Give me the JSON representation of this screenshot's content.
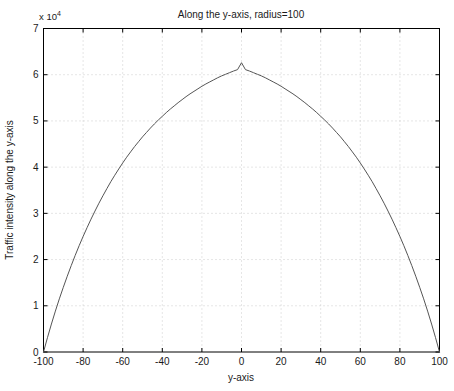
{
  "chart_data": {
    "type": "line",
    "title": "Along the y-axis, radius=100",
    "xlabel": "y-axis",
    "ylabel": "Traffic intensity along the y-axis",
    "y_exponent_label": "x 10",
    "y_exponent_power": "4",
    "y_scale_factor": 10000,
    "xlim": [
      -100,
      100
    ],
    "ylim": [
      0,
      70000
    ],
    "xticks": [
      -100,
      -80,
      -60,
      -40,
      -20,
      0,
      20,
      40,
      60,
      80,
      100
    ],
    "xticklabels": [
      "-100",
      "-80",
      "-60",
      "-40",
      "-20",
      "0",
      "20",
      "40",
      "60",
      "80",
      "100"
    ],
    "yticks": [
      0,
      10000,
      20000,
      30000,
      40000,
      50000,
      60000,
      70000
    ],
    "yticklabels": [
      "0",
      "1",
      "2",
      "3",
      "4",
      "5",
      "6",
      "7"
    ],
    "grid": true,
    "legend": false,
    "line_color": "#555555",
    "grid_color": "#cccccc",
    "axes_color": "#000000",
    "series": [
      {
        "name": "Traffic intensity along the y-axis",
        "x": [
          -100,
          -98,
          -96,
          -94,
          -92,
          -90,
          -88,
          -86,
          -84,
          -82,
          -80,
          -78,
          -76,
          -74,
          -72,
          -70,
          -68,
          -66,
          -64,
          -62,
          -60,
          -58,
          -56,
          -54,
          -52,
          -50,
          -48,
          -46,
          -44,
          -42,
          -40,
          -38,
          -36,
          -34,
          -32,
          -30,
          -28,
          -26,
          -24,
          -22,
          -20,
          -18,
          -16,
          -14,
          -12,
          -10,
          -8,
          -6,
          -4,
          -2,
          0,
          2,
          4,
          6,
          8,
          10,
          12,
          14,
          16,
          18,
          20,
          22,
          24,
          26,
          28,
          30,
          32,
          34,
          36,
          38,
          40,
          42,
          44,
          46,
          48,
          50,
          52,
          54,
          56,
          58,
          60,
          62,
          64,
          66,
          68,
          70,
          72,
          74,
          76,
          78,
          80,
          82,
          84,
          86,
          88,
          90,
          92,
          94,
          96,
          98,
          100
        ],
        "y": [
          0,
          3100,
          6050,
          8850,
          11500,
          14000,
          16400,
          18700,
          20900,
          23000,
          25000,
          26900,
          28750,
          30500,
          32200,
          33800,
          35350,
          36850,
          38250,
          39600,
          40900,
          42150,
          43300,
          44450,
          45500,
          46550,
          47500,
          48450,
          49350,
          50200,
          51000,
          51800,
          52550,
          53250,
          53950,
          54600,
          55250,
          55850,
          56400,
          56950,
          57500,
          58000,
          58450,
          58900,
          59350,
          59750,
          60100,
          60450,
          60800,
          61100,
          62600,
          61100,
          60800,
          60450,
          60100,
          59750,
          59350,
          58900,
          58450,
          58000,
          57500,
          56950,
          56400,
          55850,
          55250,
          54600,
          53950,
          53250,
          52550,
          51800,
          51000,
          50200,
          49350,
          48450,
          47500,
          46550,
          45500,
          44450,
          43300,
          42150,
          40900,
          39600,
          38250,
          36850,
          35350,
          33800,
          32200,
          30500,
          28750,
          26900,
          25000,
          23000,
          20900,
          18700,
          16400,
          14000,
          11500,
          8850,
          6050,
          3100,
          0
        ]
      }
    ],
    "peak": {
      "x": 0,
      "y": 62600
    }
  }
}
